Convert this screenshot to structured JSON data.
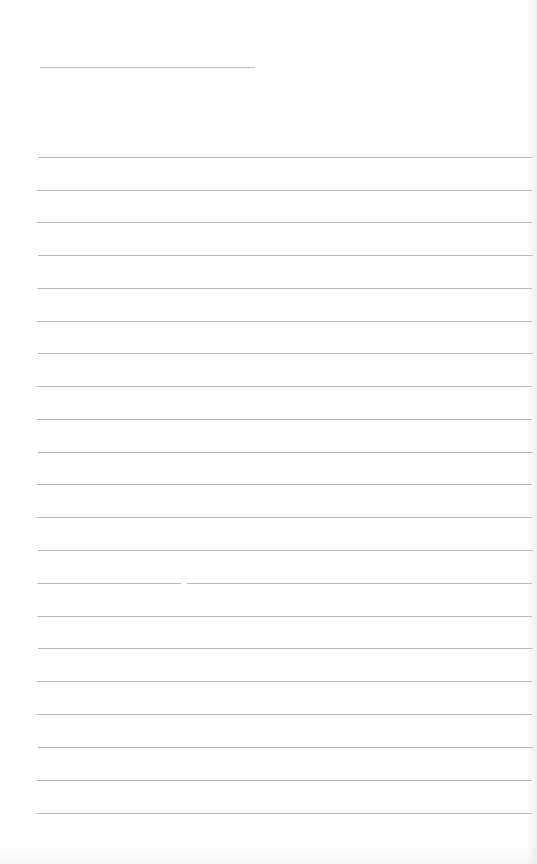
{
  "page": {
    "type": "blank ruled notebook page",
    "background_color": "#ffffff",
    "rule_color": "#b5b5b5",
    "header_line": {
      "x": 40,
      "y": 67,
      "width": 215
    },
    "rule_count": 21,
    "rules_y": [
      157,
      190,
      222,
      255,
      288,
      321,
      353,
      386,
      419,
      452,
      484,
      517,
      550,
      583,
      616,
      648,
      681,
      714,
      747,
      780,
      813
    ],
    "text_content": ""
  }
}
